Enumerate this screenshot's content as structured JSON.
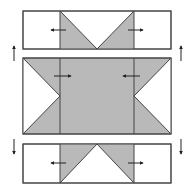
{
  "diagram": {
    "colors": {
      "background": "#ffffff",
      "fill_gray": "#b9b9b9",
      "stroke": "#444444",
      "arrow": "#222222"
    },
    "panels": [
      {
        "id": "top-strip",
        "description": "Top strip: two white side squares, center with gray V (flying geese)",
        "arrows": [
          "left",
          "right"
        ]
      },
      {
        "id": "middle-block",
        "description": "Middle block: gray center with white triangles at left and right edges",
        "arrows": [
          "right",
          "left"
        ]
      },
      {
        "id": "bottom-strip",
        "description": "Bottom strip: two white side squares, center with gray inverted V",
        "arrows": [
          "left",
          "right"
        ]
      }
    ],
    "side_arrows": {
      "upper": "up",
      "lower": "down"
    }
  }
}
